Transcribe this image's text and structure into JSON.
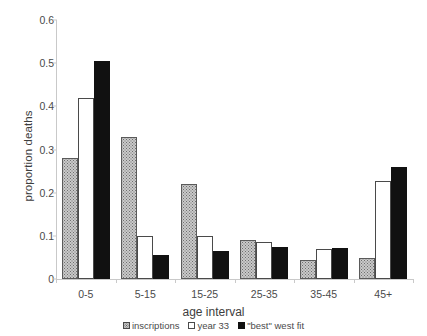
{
  "chart_data": {
    "type": "bar",
    "title": "",
    "xlabel": "age interval",
    "ylabel": "proportion deaths",
    "categories": [
      "0-5",
      "5-15",
      "15-25",
      "25-35",
      "35-45",
      "45+"
    ],
    "series": [
      {
        "name": "inscriptions",
        "pattern": "dotted-hatch",
        "color": "#c9c9c9",
        "values": [
          0.28,
          0.33,
          0.22,
          0.09,
          0.044,
          0.049
        ]
      },
      {
        "name": "year 33",
        "pattern": "open-white",
        "color": "#ffffff",
        "values": [
          0.42,
          0.1,
          0.1,
          0.086,
          0.069,
          0.227
        ]
      },
      {
        "name": "\"best\" west fit",
        "pattern": "solid-black",
        "color": "#111111",
        "values": [
          0.505,
          0.056,
          0.065,
          0.074,
          0.072,
          0.259
        ]
      }
    ],
    "ylim": [
      0,
      0.6
    ],
    "yticks": [
      "0",
      "0.1",
      "0.2",
      "0.3",
      "0.4",
      "0.5",
      "0.6"
    ],
    "ytick_values": [
      0,
      0.1,
      0.2,
      0.3,
      0.4,
      0.5,
      0.6
    ],
    "grid": false,
    "legend_position": "bottom"
  }
}
